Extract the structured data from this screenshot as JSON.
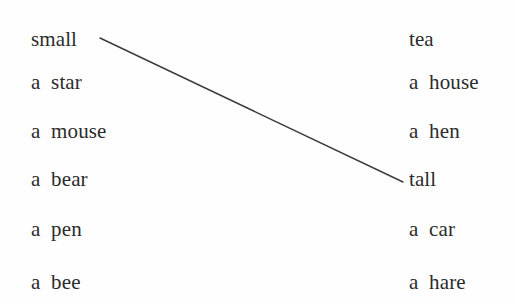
{
  "worksheet": {
    "type": "matching-exercise",
    "background_color": "#fefefe",
    "text_color": "#2b2b2b",
    "line_color": "#3a3a3a",
    "width": 515,
    "height": 304
  },
  "left_column": {
    "items": [
      {
        "label": "small",
        "x": 31,
        "baseline": 45
      },
      {
        "label": "a  star",
        "x": 31,
        "baseline": 88
      },
      {
        "label": "a  mouse",
        "x": 31,
        "baseline": 137
      },
      {
        "label": "a  bear",
        "x": 31,
        "baseline": 185
      },
      {
        "label": "a  pen",
        "x": 31,
        "baseline": 235
      },
      {
        "label": "a  bee",
        "x": 31,
        "baseline": 288
      }
    ]
  },
  "right_column": {
    "items": [
      {
        "label": "tea",
        "x": 409,
        "baseline": 45
      },
      {
        "label": "a  house",
        "x": 409,
        "baseline": 88
      },
      {
        "label": "a  hen",
        "x": 409,
        "baseline": 137
      },
      {
        "label": "tall",
        "x": 409,
        "baseline": 185
      },
      {
        "label": "a  car",
        "x": 409,
        "baseline": 235
      },
      {
        "label": "a  hare",
        "x": 409,
        "baseline": 288
      }
    ]
  },
  "connections": [
    {
      "from_label": "small",
      "to_label": "tall",
      "from_index": 0,
      "to_index": 3,
      "x1": 100,
      "y1": 38,
      "x2": 403,
      "y2": 182,
      "color": "#3a3a3a",
      "width": 1.4
    }
  ]
}
